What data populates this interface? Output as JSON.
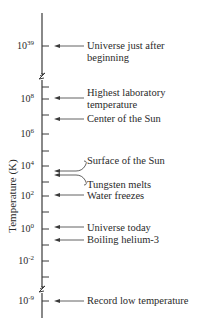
{
  "diagram": {
    "axis_label": "Temperature (K)",
    "colors": {
      "line": "#3a3a3a",
      "text": "#2a2a2a",
      "background": "#ffffff"
    },
    "axis": {
      "x": 42,
      "top": 13,
      "bottom": 318,
      "breaks_y": [
        77,
        290
      ]
    },
    "minor_ticks_y": [
      87,
      115,
      151,
      182,
      212,
      245,
      277
    ],
    "major_ticks": [
      {
        "y": 46,
        "base": "10",
        "exp": "39"
      },
      {
        "y": 99,
        "base": "10",
        "exp": "8"
      },
      {
        "y": 134,
        "base": "10",
        "exp": "6"
      },
      {
        "y": 166,
        "base": "10",
        "exp": "4"
      },
      {
        "y": 196,
        "base": "10",
        "exp": "2"
      },
      {
        "y": 229,
        "base": "10",
        "exp": "0"
      },
      {
        "y": 261,
        "base": "10",
        "exp": "-2"
      },
      {
        "y": 301,
        "base": "10",
        "exp": "-9"
      }
    ],
    "events": [
      {
        "lines": [
          "Universe just after",
          "beginning"
        ],
        "arrow_y": 46,
        "label_y": 40,
        "bent": false
      },
      {
        "lines": [
          "Highest laboratory",
          "temperature"
        ],
        "arrow_y": 98,
        "label_y": 87,
        "bent": false
      },
      {
        "lines": [
          "Center of the Sun"
        ],
        "arrow_y": 119,
        "label_y": 113,
        "bent": false
      },
      {
        "lines": [
          "Surface of the Sun"
        ],
        "arrow_y": 171,
        "label_y": 155,
        "bent": true,
        "bend_to_y": 161
      },
      {
        "lines": [
          "Tungsten melts"
        ],
        "arrow_y": 175,
        "label_y": 179,
        "bent": true,
        "bend_to_y": 185
      },
      {
        "lines": [
          "Water freezes"
        ],
        "arrow_y": 195,
        "label_y": 190,
        "bent": false
      },
      {
        "lines": [
          "Universe today"
        ],
        "arrow_y": 227,
        "label_y": 222,
        "bent": false
      },
      {
        "lines": [
          "Boiling helium-3"
        ],
        "arrow_y": 240,
        "label_y": 234,
        "bent": false
      },
      {
        "lines": [
          "Record low temperature"
        ],
        "arrow_y": 301,
        "label_y": 295,
        "bent": false
      }
    ]
  }
}
